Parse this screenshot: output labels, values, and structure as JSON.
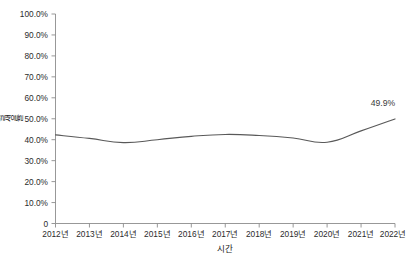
{
  "chart_data": {
    "type": "line",
    "title": "",
    "subtitle": "",
    "xlabel": "시간",
    "ylabel": "발생률",
    "categories": [
      "2012년",
      "2013년",
      "2014년",
      "2015년",
      "2016년",
      "2017년",
      "2018년",
      "2019년",
      "2020년",
      "2021년",
      "2022년"
    ],
    "x": [
      2012,
      2013,
      2014,
      2015,
      2016,
      2017,
      2018,
      2019,
      2020,
      2021,
      2022
    ],
    "series": [
      {
        "name": "발생률",
        "color": "#595959",
        "values": [
          42.3,
          40.6,
          38.6,
          40.0,
          41.6,
          42.5,
          42.0,
          40.8,
          38.8,
          44.2,
          49.9
        ]
      }
    ],
    "ylim": [
      0,
      100
    ],
    "ytick_values": [
      0,
      10,
      20,
      30,
      40,
      50,
      60,
      70,
      80,
      90,
      100
    ],
    "ytick_labels": [
      "0",
      "10.0%",
      "20.0%",
      "30.0%",
      "40.0%",
      "50.0%",
      "60.0%",
      "70.0%",
      "80.0%",
      "90.0%",
      "100.0%"
    ],
    "grid": false,
    "legend": "none",
    "annotations": [
      {
        "text": "49.9%",
        "x": 2022,
        "y": 49.9,
        "series": "발생률"
      }
    ]
  },
  "axes": {
    "y_axis_title": "발생률",
    "x_axis_title": "시간"
  }
}
